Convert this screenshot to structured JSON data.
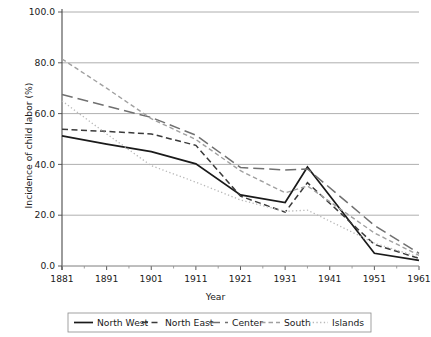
{
  "chart_data": {
    "type": "line",
    "title": "",
    "xlabel": "Year",
    "ylabel": "Incidence of child labor (%)",
    "x": [
      1881,
      1891,
      1901,
      1911,
      1921,
      1931,
      1936,
      1951,
      1961
    ],
    "xlim": [
      1881,
      1961
    ],
    "ylim": [
      0,
      100
    ],
    "xticks": [
      1881,
      1891,
      1901,
      1911,
      1921,
      1931,
      1941,
      1951,
      1961
    ],
    "xticklabels": [
      "1881",
      "1891",
      "1901",
      "1911",
      "1921",
      "1931",
      "1941",
      "1951",
      "1961"
    ],
    "yticks": [
      0,
      20,
      40,
      60,
      80,
      100
    ],
    "yticklabels": [
      "0.0",
      "20.0",
      "40.0",
      "60.0",
      "80.0",
      "100.0"
    ],
    "grid": "horizontal",
    "legend_position": "below",
    "series": [
      {
        "name": "North West",
        "style": "solid",
        "color": "#1a1a1a",
        "values": [
          51.2,
          48.0,
          45.0,
          40.2,
          28.0,
          25.0,
          39.0,
          5.0,
          2.2
        ]
      },
      {
        "name": "North East",
        "style": "dashed",
        "color": "#3a3a3a",
        "values": [
          53.8,
          53.0,
          52.0,
          47.5,
          27.5,
          21.2,
          32.8,
          8.5,
          3.0
        ]
      },
      {
        "name": "Center",
        "style": "long-dash",
        "color": "#707070",
        "values": [
          67.5,
          63.0,
          58.5,
          51.5,
          38.8,
          37.8,
          38.2,
          16.0,
          5.0
        ]
      },
      {
        "name": "South",
        "style": "small-dash",
        "color": "#a0a0a0",
        "values": [
          81.5,
          70.0,
          58.0,
          49.8,
          37.5,
          28.8,
          31.5,
          13.0,
          4.2
        ]
      },
      {
        "name": "Islands",
        "style": "dotted",
        "color": "#b8b8b8",
        "values": [
          65.0,
          52.0,
          39.5,
          33.0,
          26.0,
          21.5,
          22.0,
          9.0,
          3.5
        ]
      }
    ]
  },
  "legend": {
    "items": [
      {
        "label": "North West"
      },
      {
        "label": "North East"
      },
      {
        "label": "Center"
      },
      {
        "label": "South"
      },
      {
        "label": "Islands"
      }
    ]
  }
}
